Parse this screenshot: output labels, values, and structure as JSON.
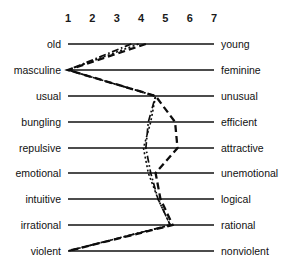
{
  "figure": {
    "type": "semantic-differential-profile",
    "width": 303,
    "height": 277,
    "background": "#ffffff",
    "ink_color": "#111111"
  },
  "scale": {
    "ticks": [
      "1",
      "2",
      "3",
      "4",
      "5",
      "6",
      "7"
    ],
    "min": 1,
    "max": 7,
    "tick_x": [
      68,
      92.3,
      116.7,
      141,
      165.3,
      189.7,
      214
    ]
  },
  "rows": [
    {
      "index": 0,
      "left": "old",
      "right": "young",
      "y": 44
    },
    {
      "index": 1,
      "left": "masculine",
      "right": "feminine",
      "y": 70
    },
    {
      "index": 2,
      "left": "usual",
      "right": "unusual",
      "y": 96
    },
    {
      "index": 3,
      "left": "bungling",
      "right": "efficient",
      "y": 122
    },
    {
      "index": 4,
      "left": "repulsive",
      "right": "attractive",
      "y": 148
    },
    {
      "index": 5,
      "left": "emotional",
      "right": "unemotional",
      "y": 173
    },
    {
      "index": 6,
      "left": "intuitive",
      "right": "logical",
      "y": 199
    },
    {
      "index": 7,
      "left": "irrational",
      "right": "rational",
      "y": 225
    },
    {
      "index": 8,
      "left": "violent",
      "right": "nonviolent",
      "y": 251
    }
  ],
  "chart_data": {
    "type": "line",
    "title": "",
    "xlabel": "",
    "ylabel": "",
    "xlim": [
      1,
      7
    ],
    "grid": false,
    "legend_position": "none",
    "orientation": "horizontal-profile",
    "categories": [
      "old–young",
      "masculine–feminine",
      "usual–unusual",
      "bungling–efficient",
      "repulsive–attractive",
      "emotional–unemotional",
      "intuitive–logical",
      "irrational–rational",
      "violent–nonviolent"
    ],
    "series": [
      {
        "name": "profile-dashed",
        "style": "dashed",
        "values": [
          4.2,
          1.0,
          4.6,
          5.4,
          5.5,
          4.6,
          4.8,
          5.3,
          1.0
        ]
      },
      {
        "name": "profile-dotted",
        "style": "dotted",
        "values": [
          3.9,
          1.0,
          4.6,
          4.4,
          4.1,
          4.3,
          4.7,
          5.2,
          1.0
        ]
      },
      {
        "name": "profile-dash-dot",
        "style": "dash-dot",
        "values": [
          3.6,
          1.0,
          4.6,
          4.3,
          4.2,
          4.4,
          4.7,
          5.2,
          1.0
        ]
      }
    ]
  }
}
